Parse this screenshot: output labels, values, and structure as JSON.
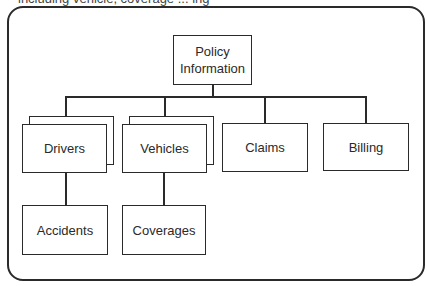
{
  "caption": "including vehicle, coverage ... ing",
  "diagram": {
    "type": "hierarchy",
    "root": {
      "label": "Policy Information"
    },
    "children": [
      {
        "label": "Drivers",
        "multiple": true,
        "children": [
          {
            "label": "Accidents"
          }
        ]
      },
      {
        "label": "Vehicles",
        "multiple": true,
        "children": [
          {
            "label": "Coverages"
          }
        ]
      },
      {
        "label": "Claims",
        "multiple": false
      },
      {
        "label": "Billing",
        "multiple": false
      }
    ]
  },
  "labels": {
    "root": "Policy Information",
    "drivers": "Drivers",
    "vehicles": "Vehicles",
    "claims": "Claims",
    "billing": "Billing",
    "accidents": "Accidents",
    "coverages": "Coverages"
  }
}
